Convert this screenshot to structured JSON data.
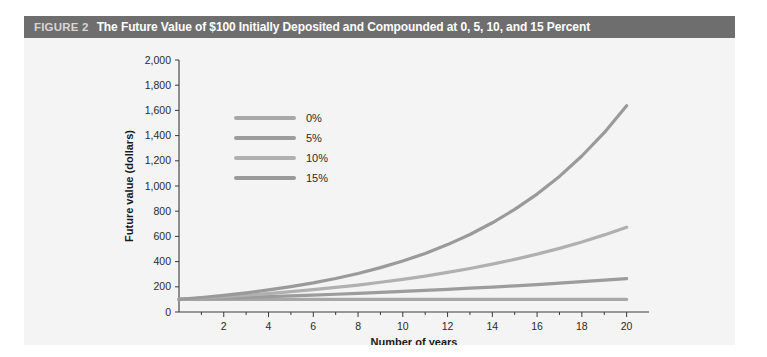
{
  "figure": {
    "label": "FIGURE 2",
    "title": "The Future Value of $100 Initially Deposited and Compounded at 0, 5, 10, and 15 Percent",
    "band_color": "#6e6e6e",
    "panel_color": "#f4f4f4"
  },
  "chart_data": {
    "type": "line",
    "title": "The Future Value of $100 Initially Deposited and Compounded at 0, 5, 10, and 15 Percent",
    "xlabel": "Number of years",
    "ylabel": "Future value (dollars)",
    "xlim": [
      0,
      21
    ],
    "ylim": [
      0,
      2000
    ],
    "xticks": [
      2,
      4,
      6,
      8,
      10,
      12,
      14,
      16,
      18,
      20
    ],
    "yticks": [
      0,
      200,
      400,
      600,
      800,
      1000,
      1200,
      1400,
      1600,
      1800,
      2000
    ],
    "ytick_labels": [
      "0",
      "200",
      "400",
      "600",
      "800",
      "1,000",
      "1,200",
      "1,400",
      "1,600",
      "1,800",
      "2,000"
    ],
    "xtick_labels": [
      "2",
      "4",
      "6",
      "8",
      "10",
      "12",
      "14",
      "16",
      "18",
      "20"
    ],
    "grid": false,
    "legend_position": "upper-left-inside",
    "principal": 100,
    "x": [
      0,
      1,
      2,
      3,
      4,
      5,
      6,
      7,
      8,
      9,
      10,
      11,
      12,
      13,
      14,
      15,
      16,
      17,
      18,
      19,
      20
    ],
    "series": [
      {
        "name": "0%",
        "rate": 0,
        "color": "#a8a8a8",
        "values": [
          100,
          100,
          100,
          100,
          100,
          100,
          100,
          100,
          100,
          100,
          100,
          100,
          100,
          100,
          100,
          100,
          100,
          100,
          100,
          100,
          100
        ]
      },
      {
        "name": "5%",
        "rate": 5,
        "color": "#9c9c9c",
        "values": [
          100,
          105,
          110,
          116,
          122,
          128,
          134,
          141,
          148,
          155,
          163,
          171,
          180,
          189,
          198,
          208,
          218,
          229,
          241,
          253,
          265
        ]
      },
      {
        "name": "10%",
        "rate": 10,
        "color": "#b0b0b0",
        "values": [
          100,
          110,
          121,
          133,
          146,
          161,
          177,
          195,
          214,
          236,
          259,
          285,
          314,
          345,
          380,
          418,
          459,
          505,
          556,
          612,
          673
        ]
      },
      {
        "name": "15%",
        "rate": 15,
        "color": "#9a9a9a",
        "values": [
          100,
          115,
          132,
          152,
          175,
          201,
          231,
          266,
          306,
          352,
          405,
          465,
          535,
          615,
          708,
          814,
          936,
          1076,
          1238,
          1423,
          1637
        ]
      }
    ]
  },
  "legend": {
    "items": [
      {
        "label": "0%",
        "color": "#a8a8a8"
      },
      {
        "label": "5%",
        "color": "#9c9c9c"
      },
      {
        "label": "10%",
        "color": "#b0b0b0"
      },
      {
        "label": "15%",
        "color": "#9a9a9a"
      }
    ]
  }
}
